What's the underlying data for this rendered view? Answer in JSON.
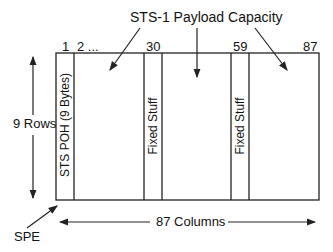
{
  "diagram": {
    "title": "STS-1 Payload Capacity",
    "column_labels": [
      "1",
      "2 ...",
      "30",
      "59",
      "87"
    ],
    "rows_label": "9 Rows",
    "columns_label": "87 Columns",
    "spe_label": "SPE",
    "poh_label": "STS POH (9 Bytes)",
    "fixed_stuff_1": "Fixed Stuff",
    "fixed_stuff_2": "Fixed Stuff",
    "colors": {
      "line": "#222222",
      "background": "#ffffff"
    }
  }
}
